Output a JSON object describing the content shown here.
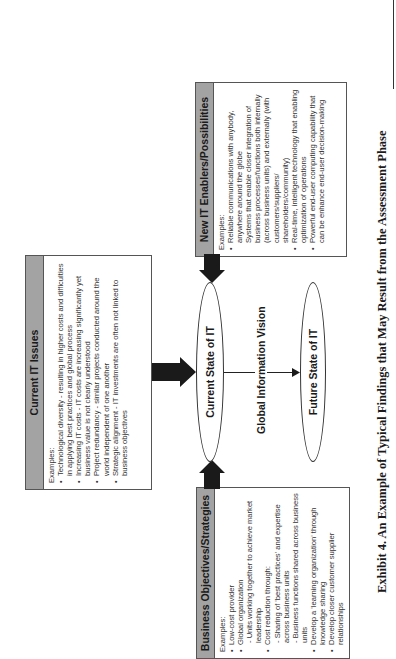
{
  "boxes": {
    "current_it_issues": {
      "title": "Current IT Issues",
      "intro": "Examples:",
      "items": [
        {
          "text": "Technological diversity - resulting in higher costs and difficulties in applying best practices and global process",
          "sub": false
        },
        {
          "text": "Increasing IT costs - IT costs are increasing significantly yet business value is not clearly understood",
          "sub": false
        },
        {
          "text": "Project redundancy - similar projects conducted around the world independent of one another",
          "sub": false
        },
        {
          "text": "Strategic alignment - IT investments are often not linked to business objectives",
          "sub": false
        }
      ]
    },
    "business_objectives": {
      "title": "Business Objectives/Strategies",
      "intro": "Examples:",
      "items": [
        {
          "text": "Low-cost provider",
          "sub": false
        },
        {
          "text": "Global organization",
          "sub": false
        },
        {
          "text": "- Units working together to achieve market leadership",
          "sub": true
        },
        {
          "text": "Cost reduction through:",
          "sub": false
        },
        {
          "text": "- Sharing of 'best practices' and expertise across business units",
          "sub": true
        },
        {
          "text": "- Business functions shared across business units",
          "sub": true
        },
        {
          "text": "Develop a 'learning organization' through knowledge sharing",
          "sub": false
        },
        {
          "text": "Develop closer customer supplier relationships",
          "sub": false
        }
      ]
    },
    "new_it_enablers": {
      "title": "New IT Enablers/Possibilities",
      "intro": "Examples:",
      "items": [
        {
          "text": "Reliable communications with anybody, anywhere around the globe",
          "sub": false
        },
        {
          "text": "Systems that enable closer integration of business processes/functions both internally (across business units) and externally (with customers/suppliers/ shareholders/community)",
          "sub": true
        },
        {
          "text": "Real-time, intelligent technology that enabling optimization of operations",
          "sub": false
        },
        {
          "text": "Powerful end-user computing capability that can be enhance end-user decision-making",
          "sub": false
        }
      ]
    }
  },
  "ellipses": {
    "current": "Current State of IT",
    "future": "Future State of IT"
  },
  "connector_label": "Global Information Vision",
  "caption": "Exhibit 4. An Example of Typical Findings that May Result from the Assessment Phase",
  "colors": {
    "header_gray": "#a3a3a3",
    "arrow": "#1a1a1a",
    "border": "#555555"
  }
}
